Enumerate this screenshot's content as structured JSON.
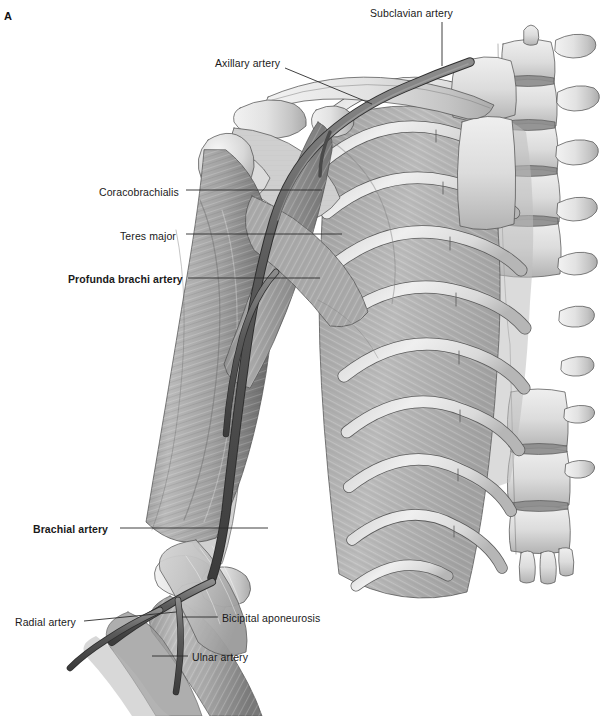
{
  "figure": {
    "panel_letter": "A",
    "kind": "anatomical-illustration",
    "style": "grayscale medical illustration",
    "background_color": "#ffffff"
  },
  "labels": [
    {
      "id": "subclavian-artery",
      "text": "Subclavian artery",
      "bold": false,
      "x": 370,
      "y": 8,
      "leader": "down"
    },
    {
      "id": "axillary-artery",
      "text": "Axillary artery",
      "bold": false,
      "x": 215,
      "y": 58,
      "leader": "diagonal-down-right"
    },
    {
      "id": "coracobrachialis",
      "text": "Coracobrachialis",
      "bold": false,
      "x": 99,
      "y": 187,
      "leader": "right"
    },
    {
      "id": "teres-major",
      "text": "Teres major",
      "bold": false,
      "x": 120,
      "y": 231,
      "leader": "right"
    },
    {
      "id": "profunda-brachi",
      "text": "Profunda brachi artery",
      "bold": true,
      "x": 68,
      "y": 274,
      "leader": "right"
    },
    {
      "id": "brachial-artery",
      "text": "Brachial artery",
      "bold": true,
      "x": 33,
      "y": 524,
      "leader": "right"
    },
    {
      "id": "radial-artery",
      "text": "Radial artery",
      "bold": false,
      "x": 15,
      "y": 617,
      "leader": "right"
    },
    {
      "id": "bicipital-aponeurosis",
      "text": "Bicipital aponeurosis",
      "bold": false,
      "x": 222,
      "y": 613,
      "leader": "left"
    },
    {
      "id": "ulnar-artery",
      "text": "Ulnar artery",
      "bold": false,
      "x": 192,
      "y": 652,
      "leader": "left"
    }
  ],
  "colors": {
    "bone_light": "#e9e9e9",
    "bone_mid": "#d2d2d2",
    "bone_shadow": "#a8a8a8",
    "muscle_light": "#bdbdbd",
    "muscle_mid": "#9b9b9b",
    "muscle_dark": "#6f6f6f",
    "intercostal": "#b4b4b4",
    "artery": "#5e5e5e",
    "artery_dark": "#3f3f3f",
    "outline": "#4a4a4a",
    "label_text": "#1a1a1a",
    "leader_line": "#2b2b2b"
  },
  "structures": {
    "bones": [
      "clavicle",
      "scapula",
      "acromion",
      "coracoid process",
      "humerus",
      "manubrium",
      "sternum",
      "ribs",
      "thoracic vertebrae",
      "lumbar vertebrae",
      "transverse processes",
      "radius",
      "ulna"
    ],
    "muscles": [
      "coracobrachialis",
      "teres major",
      "biceps brachii",
      "brachialis",
      "intercostal muscles",
      "pectoralis insertion"
    ],
    "arteries": [
      "subclavian artery",
      "axillary artery",
      "brachial artery",
      "profunda brachi artery",
      "radial artery",
      "ulnar artery"
    ],
    "other": [
      "bicipital aponeurosis"
    ],
    "rib_count": 9,
    "vertebra_count": 9
  }
}
